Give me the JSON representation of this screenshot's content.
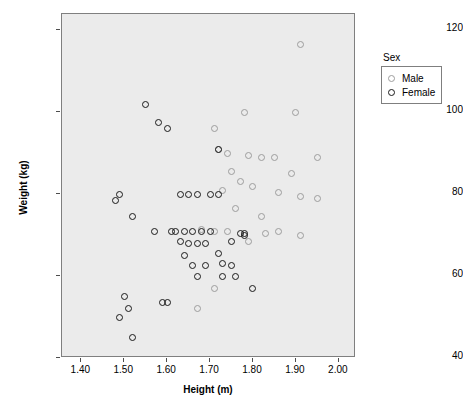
{
  "chart_data": {
    "type": "scatter",
    "title": "",
    "xlabel": "Height (m)",
    "ylabel": "Weight (kg)",
    "xlim": [
      1.355,
      2.04
    ],
    "ylim": [
      40,
      124
    ],
    "xticks": [
      "1.40",
      "1.50",
      "1.60",
      "1.70",
      "1.80",
      "1.90",
      "2.00"
    ],
    "xtick_values": [
      1.4,
      1.5,
      1.6,
      1.7,
      1.8,
      1.9,
      2.0
    ],
    "yticks": [
      "40",
      "60",
      "80",
      "100",
      "120"
    ],
    "ytick_values": [
      40,
      60,
      80,
      100,
      120
    ],
    "grid": false,
    "legend": {
      "title": "Sex",
      "position": "right",
      "entries": [
        {
          "name": "Male",
          "color": "#9d9d9d"
        },
        {
          "name": "Female",
          "color": "#1a1a1a"
        }
      ]
    },
    "series": [
      {
        "name": "Male",
        "color": "#9d9d9d",
        "points": [
          [
            1.91,
            116.5
          ],
          [
            1.78,
            100.0
          ],
          [
            1.9,
            100.0
          ],
          [
            1.71,
            96.0
          ],
          [
            1.72,
            91.0
          ],
          [
            1.74,
            90.0
          ],
          [
            1.79,
            89.5
          ],
          [
            1.82,
            89.0
          ],
          [
            1.85,
            89.0
          ],
          [
            1.95,
            89.0
          ],
          [
            1.75,
            85.5
          ],
          [
            1.89,
            85.0
          ],
          [
            1.77,
            83.0
          ],
          [
            1.8,
            82.0
          ],
          [
            1.73,
            81.0
          ],
          [
            1.86,
            80.5
          ],
          [
            1.91,
            79.5
          ],
          [
            1.95,
            79.0
          ],
          [
            1.76,
            76.5
          ],
          [
            1.82,
            74.5
          ],
          [
            1.68,
            71.5
          ],
          [
            1.71,
            71.0
          ],
          [
            1.74,
            71.0
          ],
          [
            1.86,
            71.0
          ],
          [
            1.91,
            70.0
          ],
          [
            1.83,
            70.5
          ],
          [
            1.79,
            68.5
          ],
          [
            1.67,
            52.0
          ],
          [
            1.71,
            57.0
          ]
        ]
      },
      {
        "name": "Female",
        "color": "#1a1a1a",
        "points": [
          [
            1.55,
            102.0
          ],
          [
            1.58,
            97.5
          ],
          [
            1.6,
            96.0
          ],
          [
            1.72,
            91.0
          ],
          [
            1.49,
            80.0
          ],
          [
            1.48,
            78.5
          ],
          [
            1.63,
            80.0
          ],
          [
            1.65,
            80.0
          ],
          [
            1.67,
            80.0
          ],
          [
            1.7,
            80.0
          ],
          [
            1.72,
            80.0
          ],
          [
            1.52,
            74.5
          ],
          [
            1.57,
            71.0
          ],
          [
            1.61,
            71.0
          ],
          [
            1.62,
            71.0
          ],
          [
            1.64,
            71.0
          ],
          [
            1.66,
            71.0
          ],
          [
            1.68,
            71.0
          ],
          [
            1.7,
            71.0
          ],
          [
            1.63,
            68.5
          ],
          [
            1.65,
            68.0
          ],
          [
            1.67,
            68.0
          ],
          [
            1.69,
            68.0
          ],
          [
            1.77,
            70.5
          ],
          [
            1.78,
            70.5
          ],
          [
            1.78,
            70.0
          ],
          [
            1.75,
            68.5
          ],
          [
            1.64,
            65.0
          ],
          [
            1.66,
            62.5
          ],
          [
            1.69,
            62.5
          ],
          [
            1.73,
            63.0
          ],
          [
            1.75,
            62.5
          ],
          [
            1.72,
            65.5
          ],
          [
            1.67,
            60.0
          ],
          [
            1.73,
            60.0
          ],
          [
            1.76,
            60.0
          ],
          [
            1.8,
            57.0
          ],
          [
            1.5,
            55.0
          ],
          [
            1.51,
            52.0
          ],
          [
            1.49,
            50.0
          ],
          [
            1.59,
            53.5
          ],
          [
            1.6,
            53.5
          ],
          [
            1.52,
            45.0
          ]
        ]
      }
    ]
  }
}
